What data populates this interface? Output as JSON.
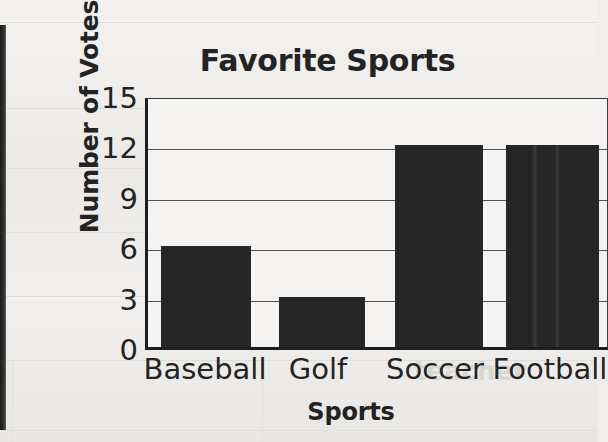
{
  "chart_data": {
    "type": "bar",
    "title": "Favorite Sports",
    "xlabel": "Sports",
    "ylabel": "Number of Votes",
    "categories": [
      "Baseball",
      "Golf",
      "Soccer",
      "Football"
    ],
    "values": [
      6,
      3,
      12,
      12
    ],
    "ylim": [
      0,
      15
    ],
    "yticks": [
      0,
      3,
      6,
      9,
      12,
      15
    ],
    "ytick_labels": [
      "0",
      "3",
      "6",
      "9",
      "12",
      "15"
    ],
    "grid": true,
    "grid_axis": "y",
    "legend": null,
    "bar_color": "#262626",
    "background_color": "#efeeec",
    "text_color": "#232323"
  },
  "ticks": {
    "y": [
      {
        "label": "15",
        "value": 15
      },
      {
        "label": "12",
        "value": 12
      },
      {
        "label": "9",
        "value": 9
      },
      {
        "label": "6",
        "value": 6
      },
      {
        "label": "3",
        "value": 3
      },
      {
        "label": "0",
        "value": 0
      }
    ],
    "x": [
      {
        "label": "Baseball",
        "value": 6
      },
      {
        "label": "Golf",
        "value": 3
      },
      {
        "label": "Soccer",
        "value": 12
      },
      {
        "label": "Football",
        "value": 12
      }
    ]
  },
  "scan_artifacts": {
    "show_through_texts": [
      {
        "text": "10 of",
        "x": 250,
        "y": 318
      },
      {
        "text": "made up",
        "x": 455,
        "y": 318
      },
      {
        "text": "teacher",
        "x": 420,
        "y": 372
      }
    ]
  }
}
